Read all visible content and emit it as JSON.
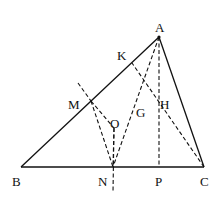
{
  "diagram": {
    "title": "",
    "points": {
      "A": {
        "label": "A",
        "x": 159,
        "y": 37,
        "lx": 155,
        "ly": 32
      },
      "B": {
        "label": "B",
        "x": 21,
        "y": 167,
        "lx": 12,
        "ly": 186
      },
      "C": {
        "label": "C",
        "x": 204,
        "y": 167,
        "lx": 200,
        "ly": 186
      },
      "K": {
        "label": "K",
        "x": 132,
        "y": 63,
        "lx": 117,
        "ly": 60
      },
      "M": {
        "label": "M",
        "x": 91,
        "y": 101,
        "lx": 68,
        "ly": 109
      },
      "O": {
        "label": "O",
        "x": 114,
        "y": 128,
        "lx": 110,
        "ly": 128
      },
      "G": {
        "label": "G",
        "x": 130,
        "y": 113,
        "lx": 136,
        "ly": 117
      },
      "H": {
        "label": "H",
        "x": 159,
        "y": 99,
        "lx": 160,
        "ly": 109
      },
      "N": {
        "label": "N",
        "x": 113,
        "y": 167,
        "lx": 98,
        "ly": 186
      },
      "P": {
        "label": "P",
        "x": 159,
        "y": 167,
        "lx": 155,
        "ly": 186
      }
    },
    "solid_segments": [
      [
        "A",
        "B"
      ],
      [
        "B",
        "C"
      ],
      [
        "C",
        "A"
      ]
    ],
    "dashed_segments": [
      [
        "A",
        "N"
      ],
      [
        "A",
        "P"
      ],
      [
        "C",
        "K"
      ],
      [
        "M",
        "N"
      ],
      [
        "O",
        "N"
      ],
      [
        "M",
        "O"
      ]
    ],
    "extra_dashed": [
      {
        "name": "perp-bisector-ext",
        "x1": 78,
        "y1": 83,
        "x2": 91,
        "y2": 101
      },
      {
        "name": "n-vertical",
        "x1": 114,
        "y1": 128,
        "x2": 113,
        "y2": 192
      }
    ],
    "labels": [
      "A",
      "B",
      "C",
      "K",
      "M",
      "O",
      "G",
      "H",
      "N",
      "P"
    ]
  }
}
